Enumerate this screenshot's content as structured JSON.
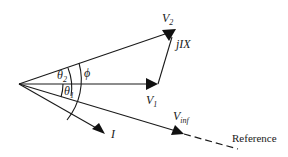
{
  "phasors": [
    {
      "id": "V2",
      "label": "V",
      "sub": "2"
    },
    {
      "id": "V1",
      "label": "V",
      "sub": "1"
    },
    {
      "id": "jIX",
      "label": "jIX"
    },
    {
      "id": "I",
      "label": "I"
    },
    {
      "id": "Vinf",
      "label": "V",
      "sub": "inf"
    }
  ],
  "angles": [
    {
      "id": "theta2",
      "label": "θ",
      "sub": "2"
    },
    {
      "id": "theta1",
      "label": "θ",
      "sub": "1"
    },
    {
      "id": "phi",
      "label": "ϕ"
    }
  ],
  "reference": {
    "label": "Reference",
    "style": "dashed"
  },
  "colors": {
    "ink": "#1a1a1a",
    "background": "#ffffff"
  }
}
